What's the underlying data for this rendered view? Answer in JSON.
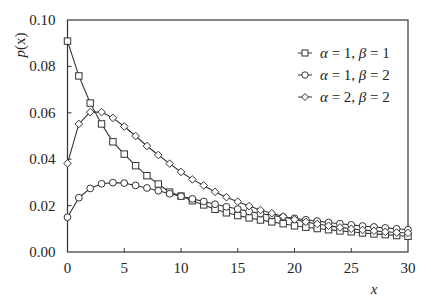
{
  "chart_data": {
    "type": "line",
    "title": "",
    "xlabel": "x",
    "ylabel": "p(x)",
    "xlim": [
      0,
      30
    ],
    "ylim": [
      0,
      0.1
    ],
    "grid": false,
    "legend_position": "upper right",
    "x_ticks": [
      0,
      5,
      10,
      15,
      20,
      25,
      30
    ],
    "x_tick_labels": [
      "0",
      "5",
      "10",
      "15",
      "20",
      "25",
      "30"
    ],
    "y_ticks": [
      0,
      0.02,
      0.04,
      0.06,
      0.08,
      0.1
    ],
    "y_tick_labels": [
      "0.00",
      "0.02",
      "0.04",
      "0.06",
      "0.08",
      "0.10"
    ],
    "x": [
      0,
      1,
      2,
      3,
      4,
      5,
      6,
      7,
      8,
      9,
      10,
      11,
      12,
      13,
      14,
      15,
      16,
      17,
      18,
      19,
      20,
      21,
      22,
      23,
      24,
      25,
      26,
      27,
      28,
      29,
      30
    ],
    "series": [
      {
        "name": "α = 1, β = 1",
        "alpha": "1",
        "beta": "1",
        "marker": "square",
        "values": [
          0.0909,
          0.0759,
          0.0642,
          0.0552,
          0.0475,
          0.0422,
          0.0372,
          0.0329,
          0.0293,
          0.0258,
          0.0241,
          0.0221,
          0.0203,
          0.0184,
          0.0169,
          0.0157,
          0.0147,
          0.0138,
          0.013,
          0.0122,
          0.0113,
          0.0107,
          0.0101,
          0.0096,
          0.0091,
          0.0087,
          0.0082,
          0.0078,
          0.0075,
          0.0071,
          0.0068
        ]
      },
      {
        "name": "α = 1, β = 2",
        "alpha": "1",
        "beta": "2",
        "marker": "circle",
        "values": [
          0.015,
          0.0234,
          0.0274,
          0.0294,
          0.0299,
          0.0297,
          0.0287,
          0.0276,
          0.0264,
          0.0251,
          0.024,
          0.0229,
          0.0218,
          0.0206,
          0.0195,
          0.0185,
          0.0175,
          0.0166,
          0.0158,
          0.0151,
          0.0145,
          0.0139,
          0.0133,
          0.0127,
          0.0122,
          0.0117,
          0.0112,
          0.0108,
          0.0104,
          0.01,
          0.0096
        ]
      },
      {
        "name": "α = 2, β = 2",
        "alpha": "2",
        "beta": "2",
        "marker": "diamond",
        "values": [
          0.0382,
          0.0552,
          0.0603,
          0.0603,
          0.0578,
          0.0541,
          0.05,
          0.0457,
          0.0418,
          0.0381,
          0.0345,
          0.0313,
          0.0287,
          0.0259,
          0.0236,
          0.0217,
          0.0198,
          0.0181,
          0.0167,
          0.0153,
          0.014,
          0.013,
          0.0121,
          0.0113,
          0.0106,
          0.01,
          0.0095,
          0.0091,
          0.0087,
          0.0084,
          0.0082
        ]
      }
    ]
  },
  "legend": {
    "items": [
      {
        "greek_a": "α",
        "a_val": " = 1, ",
        "greek_b": "β",
        "b_val": " = 1"
      },
      {
        "greek_a": "α",
        "a_val": " = 1, ",
        "greek_b": "β",
        "b_val": " = 2"
      },
      {
        "greek_a": "α",
        "a_val": " = 2, ",
        "greek_b": "β",
        "b_val": " = 2"
      }
    ]
  },
  "axes": {
    "ylabel_p": "p",
    "ylabel_paren": "(x)",
    "xlabel": "x"
  },
  "colors": {
    "line": "#333333",
    "axis": "#333333",
    "marker_fill": "#ffffff",
    "background": "#ffffff"
  }
}
